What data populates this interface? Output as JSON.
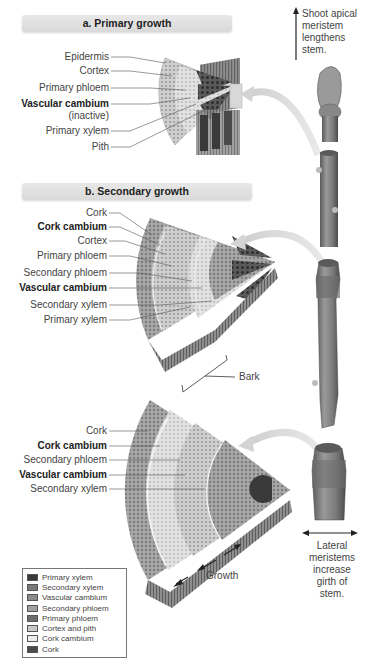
{
  "panel_a": {
    "title": "a. Primary growth",
    "labels": [
      {
        "text": "Epidermis",
        "bold": false
      },
      {
        "text": "Cortex",
        "bold": false
      },
      {
        "text": "Primary phloem",
        "bold": false
      },
      {
        "text": "Vascular cambium",
        "bold": true
      },
      {
        "text": "(inactive)",
        "bold": false
      },
      {
        "text": "Primary xylem",
        "bold": false
      },
      {
        "text": "Pith",
        "bold": false
      }
    ]
  },
  "panel_b": {
    "title": "b. Secondary growth",
    "labels": [
      {
        "text": "Cork",
        "bold": false
      },
      {
        "text": "Cork cambium",
        "bold": true
      },
      {
        "text": "Cortex",
        "bold": false
      },
      {
        "text": "Primary phloem",
        "bold": false
      },
      {
        "text": "Secondary phloem",
        "bold": false
      },
      {
        "text": "Vascular cambium",
        "bold": true
      },
      {
        "text": "Secondary xylem",
        "bold": false
      },
      {
        "text": "Primary xylem",
        "bold": false
      }
    ],
    "bark_label": "Bark"
  },
  "panel_c": {
    "labels": [
      {
        "text": "Cork",
        "bold": false
      },
      {
        "text": "Cork cambium",
        "bold": true
      },
      {
        "text": "Secondary phloem",
        "bold": false
      },
      {
        "text": "Vascular cambium",
        "bold": true
      },
      {
        "text": "Secondary xylem",
        "bold": false
      }
    ],
    "growth_label": "Growth"
  },
  "notes": {
    "apical": [
      "Shoot apical",
      "meristem",
      "lengthens",
      "stem."
    ],
    "lateral": [
      "Lateral",
      "meristems",
      "increase",
      "girth of",
      "stem."
    ]
  },
  "legend": [
    {
      "label": "Primary xylem",
      "color": "#3a3a3a"
    },
    {
      "label": "Secondary xylem",
      "color": "#7a7a7a"
    },
    {
      "label": "Vascular cambium",
      "color": "#8a8a8a"
    },
    {
      "label": "Secondary phloem",
      "color": "#a0a0a0"
    },
    {
      "label": "Primary phloem",
      "color": "#6e6e6e"
    },
    {
      "label": "Cortex and pith",
      "color": "#c8c8c8"
    },
    {
      "label": "Cork cambium",
      "color": "#ececec"
    },
    {
      "label": "Cork",
      "color": "#4a4a4a"
    }
  ]
}
